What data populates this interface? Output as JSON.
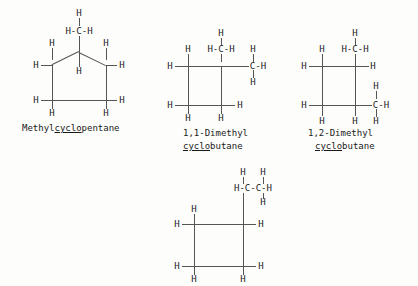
{
  "page": {
    "background": "#fdfdfb",
    "ink": "#222222",
    "bond_color": "#555555",
    "width": 418,
    "height": 286
  },
  "atom_labels": {
    "hydrogen": "H",
    "carbon": "C",
    "h_c_h": "H-C-H",
    "c_h": "C-H",
    "h_c": "H-C",
    "h_c_c_h": "H-C-C-H"
  },
  "structures": [
    {
      "id": "methylcyclopentane",
      "ring": "cyclopentane",
      "substituent": "methyl",
      "caption_lines": [
        {
          "pre": "Methyl",
          "underline": "cyclo",
          "post": "pentane"
        }
      ],
      "caption_plain": "Methylcyclopentane"
    },
    {
      "id": "1-1-dimethylcyclobutane",
      "ring": "cyclobutane",
      "substituent": "1,1-dimethyl",
      "caption_lines": [
        {
          "pre": "1,1-Dimethyl",
          "underline": "",
          "post": ""
        },
        {
          "pre": "",
          "underline": "cyclo",
          "post": "butane"
        }
      ],
      "caption_plain": "1,1-Dimethylcyclobutane"
    },
    {
      "id": "1-2-dimethylcyclobutane",
      "ring": "cyclobutane",
      "substituent": "1,2-dimethyl",
      "caption_lines": [
        {
          "pre": "1,2-Dimethyl",
          "underline": "",
          "post": ""
        },
        {
          "pre": "",
          "underline": "cyclo",
          "post": "butane"
        }
      ],
      "caption_plain": "1,2-Dimethylcyclobutane"
    },
    {
      "id": "ethylcyclobutane",
      "ring": "cyclobutane",
      "substituent": "ethyl",
      "caption_lines": [],
      "caption_plain": ""
    }
  ],
  "s1": {
    "name": "methylcyclopentane",
    "methyl_top_h": "H",
    "methyl_hch": "H-C-H",
    "ring_h_upper_left": "H",
    "ring_h_upper_right": "H",
    "ring_h_left_upper": "H",
    "ring_h_right_upper": "H",
    "apex_h_below": "H",
    "ring_h_left_lower": "H",
    "ring_h_right_lower": "H",
    "ring_h_bottom_left": "H",
    "ring_h_bottom_right": "H",
    "caption_pre": "Methyl",
    "caption_underline": "cyclo",
    "caption_post": "pentane"
  },
  "s2": {
    "name": "1,1-dimethylcyclobutane",
    "methyl_top_h": "H",
    "methyl_hch": "H-C-H",
    "right_methyl_top_h": "H",
    "right_methyl_ch": "C-H",
    "right_methyl_bottom_h": "H",
    "ring_h_topleft_up": "H",
    "ring_h_topleft_left": "H",
    "ring_h_botleft_left": "H",
    "ring_h_botleft_down": "H",
    "ring_h_botright_right": "H",
    "ring_h_botright_down": "H",
    "caption_line1": "1,1-Dimethyl",
    "caption_line2_underline": "cyclo",
    "caption_line2_post": "butane"
  },
  "s3": {
    "name": "1,2-dimethylcyclobutane",
    "methyl_top_h": "H",
    "methyl_hch": "H-C-H",
    "ring_h_topleft_up": "H",
    "ring_h_topleft_left": "H",
    "ring_h_topright_right": "H",
    "right_methyl_top_h": "H",
    "right_methyl_ch": "C-H",
    "right_methyl_bottom_h": "H",
    "ring_h_botleft_left": "H",
    "ring_h_botleft_down": "H",
    "ring_h_botright_down": "H",
    "caption_line1": "1,2-Dimethyl",
    "caption_line2_underline": "cyclo",
    "caption_line2_post": "butane"
  },
  "s4": {
    "name": "ethylcyclobutane",
    "ethyl_top_h_left": "H",
    "ethyl_top_h_right": "H",
    "ethyl_chain": "H-C-C-H",
    "ethyl_bottom_h": "H",
    "ring_h_topleft_up": "H",
    "ring_h_topleft_left": "H",
    "ring_h_topright_right": "H",
    "ring_h_botleft_left": "H",
    "ring_h_botleft_down": "H",
    "ring_h_botright_right": "H",
    "ring_h_botright_down": "H"
  }
}
